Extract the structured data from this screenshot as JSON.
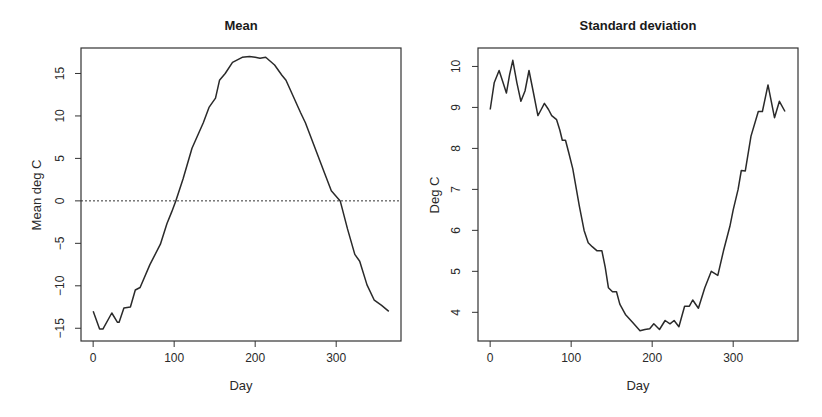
{
  "chart_data": [
    {
      "type": "line",
      "title": "Mean",
      "xlabel": "Day",
      "ylabel": "Mean deg C",
      "xlim": [
        -15,
        380
      ],
      "ylim": [
        -16.5,
        18
      ],
      "xticks": [
        0,
        100,
        200,
        300
      ],
      "yticks": [
        -15,
        -10,
        -5,
        0,
        5,
        10,
        15
      ],
      "ytick_labels": [
        "−15",
        "−10",
        "−5",
        "0",
        "5",
        "10",
        "15"
      ],
      "grid": false,
      "reference_line": {
        "y": 0,
        "style": "dotted"
      },
      "series": [
        {
          "name": "Mean",
          "x": [
            0,
            8,
            12,
            23,
            30,
            32,
            38,
            46,
            52,
            58,
            70,
            83,
            91,
            97,
            102,
            111,
            122,
            136,
            143,
            151,
            156,
            163,
            172,
            184,
            193,
            200,
            206,
            213,
            224,
            233,
            238,
            256,
            262,
            274,
            286,
            294,
            305,
            314,
            323,
            329,
            338,
            347,
            356,
            365
          ],
          "y": [
            -13.0,
            -15.1,
            -15.1,
            -13.2,
            -14.3,
            -14.3,
            -12.6,
            -12.5,
            -10.5,
            -10.2,
            -7.5,
            -5.1,
            -2.7,
            -1.3,
            0.0,
            2.6,
            6.2,
            9.2,
            11.0,
            12.1,
            14.2,
            15.0,
            16.3,
            16.9,
            17.0,
            16.9,
            16.8,
            16.9,
            16.0,
            14.8,
            14.2,
            10.4,
            9.2,
            6.2,
            3.2,
            1.2,
            0.0,
            -3.3,
            -6.3,
            -7.1,
            -9.9,
            -11.7,
            -12.3,
            -13.0
          ]
        }
      ]
    },
    {
      "type": "line",
      "title": "Standard deviation",
      "xlabel": "Day",
      "ylabel": "Deg C",
      "xlim": [
        -15,
        380
      ],
      "ylim": [
        3.3,
        10.45
      ],
      "xticks": [
        0,
        100,
        200,
        300
      ],
      "yticks": [
        4,
        5,
        6,
        7,
        8,
        9,
        10
      ],
      "ytick_labels": [
        "4",
        "5",
        "6",
        "7",
        "8",
        "9",
        "10"
      ],
      "grid": false,
      "series": [
        {
          "name": "Standard deviation",
          "x": [
            0,
            5,
            11,
            16,
            20,
            24,
            28,
            33,
            38,
            43,
            48,
            53,
            59,
            63,
            67,
            72,
            76,
            82,
            86,
            89,
            93,
            97,
            102,
            110,
            116,
            121,
            126,
            132,
            138,
            142,
            146,
            151,
            156,
            160,
            167,
            176,
            185,
            191,
            197,
            202,
            209,
            216,
            222,
            227,
            233,
            240,
            246,
            250,
            257,
            265,
            273,
            281,
            288,
            296,
            300,
            306,
            310,
            315,
            322,
            331,
            336,
            343,
            351,
            357,
            364
          ],
          "y": [
            8.95,
            9.6,
            9.9,
            9.6,
            9.35,
            9.8,
            10.15,
            9.6,
            9.15,
            9.4,
            9.9,
            9.4,
            8.8,
            8.95,
            9.1,
            8.95,
            8.8,
            8.7,
            8.45,
            8.2,
            8.2,
            7.9,
            7.5,
            6.6,
            6.0,
            5.7,
            5.6,
            5.5,
            5.5,
            5.1,
            4.6,
            4.5,
            4.5,
            4.2,
            3.95,
            3.75,
            3.55,
            3.58,
            3.6,
            3.72,
            3.58,
            3.8,
            3.72,
            3.8,
            3.65,
            4.15,
            4.15,
            4.3,
            4.1,
            4.6,
            5.0,
            4.9,
            5.5,
            6.1,
            6.5,
            7.0,
            7.46,
            7.45,
            8.3,
            8.9,
            8.9,
            9.55,
            8.75,
            9.15,
            8.9
          ]
        }
      ]
    }
  ],
  "panels": {
    "left": {
      "title": "Mean",
      "xlabel": "Day",
      "ylabel": "Mean deg C"
    },
    "right": {
      "title": "Standard deviation",
      "xlabel": "Day",
      "ylabel": "Deg C"
    }
  }
}
